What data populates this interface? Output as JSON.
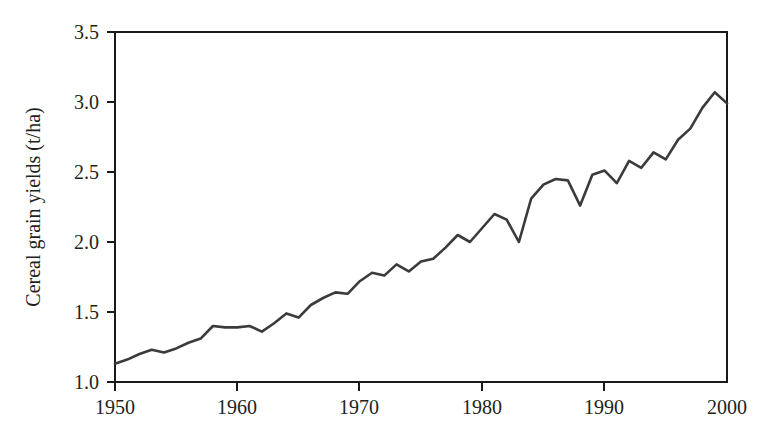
{
  "figure": {
    "background_color": "#ffffff",
    "line_color": "#3c3b3b",
    "axis_color": "#1a1a1a",
    "text_color": "#231f20"
  },
  "chart_data": {
    "type": "line",
    "title": "",
    "subtitle": "",
    "xlabel": "",
    "ylabel": "Cereal grain yields (t/ha)",
    "xlim": [
      1950,
      2000
    ],
    "ylim": [
      1.0,
      3.5
    ],
    "grid": false,
    "legend": null,
    "x_ticks": [
      1950,
      1960,
      1970,
      1980,
      1990,
      2000
    ],
    "x_tick_labels": [
      "1950",
      "1960",
      "1970",
      "1980",
      "1990",
      "2000"
    ],
    "x_minor_ticks": [
      1955,
      1965,
      1975,
      1985,
      1995
    ],
    "y_ticks": [
      1.0,
      1.5,
      2.0,
      2.5,
      3.0,
      3.5
    ],
    "y_tick_labels": [
      "1.0",
      "1.5",
      "2.0",
      "2.5",
      "3.0",
      "3.5"
    ],
    "series": [
      {
        "name": "Cereal grain yields",
        "color": "#3c3b3b",
        "x": [
          1950,
          1951,
          1952,
          1953,
          1954,
          1955,
          1956,
          1957,
          1958,
          1959,
          1960,
          1961,
          1962,
          1963,
          1964,
          1965,
          1966,
          1967,
          1968,
          1969,
          1970,
          1971,
          1972,
          1973,
          1974,
          1975,
          1976,
          1977,
          1978,
          1979,
          1980,
          1981,
          1982,
          1983,
          1984,
          1985,
          1986,
          1987,
          1988,
          1989,
          1990,
          1991,
          1992,
          1993,
          1994,
          1995,
          1996,
          1997,
          1998,
          1999,
          2000
        ],
        "y": [
          1.13,
          1.16,
          1.2,
          1.23,
          1.21,
          1.24,
          1.28,
          1.31,
          1.4,
          1.39,
          1.39,
          1.4,
          1.36,
          1.42,
          1.49,
          1.46,
          1.55,
          1.6,
          1.64,
          1.63,
          1.72,
          1.78,
          1.76,
          1.84,
          1.79,
          1.86,
          1.88,
          1.96,
          2.05,
          2.0,
          2.1,
          2.2,
          2.16,
          2.0,
          2.31,
          2.41,
          2.45,
          2.44,
          2.26,
          2.48,
          2.51,
          2.42,
          2.58,
          2.53,
          2.64,
          2.59,
          2.73,
          2.81,
          2.96,
          3.07,
          2.99
        ]
      }
    ],
    "annotations": []
  }
}
